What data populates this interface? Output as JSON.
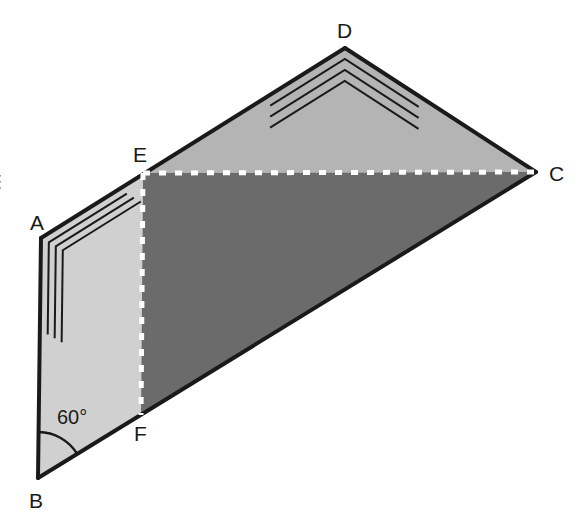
{
  "figure": {
    "canvas": {
      "width": 581,
      "height": 523,
      "background": "#ffffff"
    },
    "colors": {
      "background": "#ffffff",
      "outline": "#1a1a1a",
      "face_abfe_fill": "#d0d0d0",
      "face_edc_fill": "#b4b4b4",
      "face_efc_fill": "#6b6b6b",
      "dashed_line": "#ffffff",
      "angle_mark": "#1a1a1a",
      "label_color": "#1a1a1a"
    },
    "vertices": [
      {
        "name": "A",
        "x": 41,
        "y": 238,
        "label": "A",
        "label_x": 30,
        "label_y": 212
      },
      {
        "name": "B",
        "x": 38,
        "y": 478,
        "label": "B",
        "label_x": 29,
        "label_y": 490
      },
      {
        "name": "C",
        "x": 536,
        "y": 172,
        "label": "C",
        "label_x": 549,
        "label_y": 163
      },
      {
        "name": "D",
        "x": 345,
        "y": 48,
        "label": "D",
        "label_x": 337,
        "label_y": 20
      },
      {
        "name": "E",
        "x": 143,
        "y": 173,
        "label": "E",
        "label_x": 133,
        "label_y": 144
      },
      {
        "name": "F",
        "x": 141,
        "y": 415,
        "label": "F",
        "label_x": 134,
        "label_y": 423
      }
    ],
    "faces": [
      {
        "name": "face-abfe",
        "vertex_path": "A,E,F,B",
        "fill": "#d0d0d0"
      },
      {
        "name": "face-edc",
        "vertex_path": "E,D,C",
        "fill": "#b4b4b4"
      },
      {
        "name": "face-efc",
        "vertex_path": "E,C,F",
        "fill": "#6b6b6b"
      }
    ],
    "solid_edges": [
      {
        "name": "edge-ab",
        "from": "A",
        "to": "B"
      },
      {
        "name": "edge-ad",
        "from": "A",
        "to": "D"
      },
      {
        "name": "edge-dc",
        "from": "D",
        "to": "C"
      },
      {
        "name": "edge-bc",
        "from": "B",
        "to": "C"
      }
    ],
    "dashed_edges": [
      {
        "name": "edge-ec",
        "from": "E",
        "to": "C",
        "style": "dashed",
        "color": "#ffffff"
      },
      {
        "name": "edge-ef",
        "from": "E",
        "to": "F",
        "style": "dashed",
        "color": "#ffffff"
      }
    ],
    "angle_marks": [
      {
        "name": "angle-mark-a",
        "at_vertex": "A",
        "type": "nested-chevron",
        "count": 3,
        "note": "three nested right-angle chevron marks inside face ABFE at vertex A"
      },
      {
        "name": "angle-mark-d",
        "at_vertex": "D",
        "type": "nested-chevron",
        "count": 3,
        "note": "three nested chevron marks inside face EDC at apex D"
      },
      {
        "name": "angle-mark-b",
        "at_vertex": "B",
        "type": "arc",
        "count": 1,
        "value": "60°",
        "label_x": 57,
        "label_y": 407
      }
    ],
    "clipped_edge_mark": {
      "name": "left-edge-clipped-glyph",
      "x": 0,
      "y": 172,
      "text": "E"
    }
  }
}
